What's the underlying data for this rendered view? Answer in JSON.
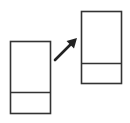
{
  "diagram": {
    "stroke_color": "#333333",
    "background_color": "#ffffff",
    "nodes": [
      {
        "id": "source-panel",
        "role": "source",
        "sections": 2,
        "divider_fraction": 0.71
      },
      {
        "id": "target-panel",
        "role": "target",
        "sections": 2,
        "divider_fraction": 0.72
      }
    ],
    "edges": [
      {
        "from": "source-panel",
        "to": "target-panel",
        "type": "arrow",
        "direction": "up-right"
      }
    ],
    "icons": [
      "source-panel-icon",
      "arrow-up-right-icon",
      "target-panel-icon"
    ]
  }
}
